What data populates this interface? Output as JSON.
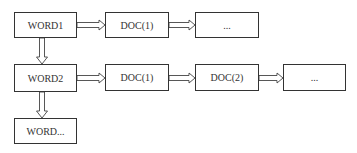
{
  "diagram": {
    "type": "inverted-index-linked-list",
    "rows": [
      {
        "word": "WORD1",
        "docs": [
          "DOC(1)",
          "..."
        ]
      },
      {
        "word": "WORD2",
        "docs": [
          "DOC(1)",
          "DOC(2)",
          "..."
        ]
      },
      {
        "word": "WORD..."
      }
    ],
    "colors": {
      "stroke": "#333333",
      "background": "#ffffff"
    }
  }
}
